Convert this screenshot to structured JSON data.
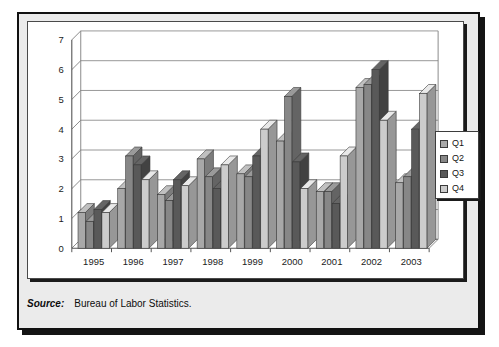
{
  "figure": {
    "source_label": "Source:",
    "source_text": "Bureau of Labor Statistics."
  },
  "legend": {
    "position": "right",
    "entries": [
      {
        "label": "Q1",
        "color": "#a8a8a8"
      },
      {
        "label": "Q2",
        "color": "#878787"
      },
      {
        "label": "Q3",
        "color": "#595959"
      },
      {
        "label": "Q4",
        "color": "#cccccc"
      }
    ]
  },
  "axis": {
    "y_ticks": [
      "0",
      "1",
      "2",
      "3",
      "4",
      "5",
      "6",
      "7"
    ],
    "x_ticks": [
      "1995",
      "1996",
      "1997",
      "1998",
      "1999",
      "2000",
      "2001",
      "2002",
      "2003"
    ]
  },
  "chart_data": {
    "type": "bar",
    "title": "",
    "subtitle": "",
    "xlabel": "",
    "ylabel": "",
    "ylim": [
      0,
      7
    ],
    "ytick_step": 1,
    "grid": true,
    "legend_position": "right",
    "style": "3d-clustered-column",
    "categories": [
      "1995",
      "1996",
      "1997",
      "1998",
      "1999",
      "2000",
      "2001",
      "2002",
      "2003"
    ],
    "series": [
      {
        "name": "Q1",
        "color": "#a8a8a8",
        "values": [
          1.2,
          2.0,
          1.8,
          3.0,
          2.5,
          3.6,
          1.9,
          5.4,
          2.2
        ]
      },
      {
        "name": "Q2",
        "color": "#878787",
        "values": [
          0.9,
          3.1,
          1.6,
          2.4,
          2.4,
          5.1,
          1.9,
          5.5,
          2.4
        ]
      },
      {
        "name": "Q3",
        "color": "#595959",
        "values": [
          1.3,
          2.8,
          2.3,
          2.0,
          3.1,
          2.9,
          1.5,
          6.0,
          4.0
        ]
      },
      {
        "name": "Q4",
        "color": "#cccccc",
        "values": [
          1.2,
          2.3,
          2.1,
          2.8,
          4.0,
          2.0,
          3.1,
          4.3,
          5.2
        ]
      }
    ]
  }
}
